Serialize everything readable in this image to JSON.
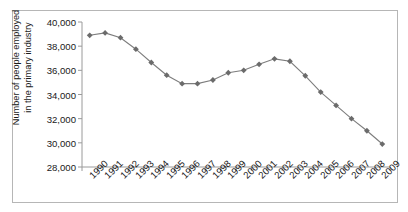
{
  "chart_data": {
    "type": "line",
    "title": "",
    "xlabel": "",
    "ylabel": "Number of people employed\nin the primary industry",
    "ylim": [
      28000,
      40000
    ],
    "ytick_step": 2000,
    "yticks": [
      "28,000",
      "30,000",
      "32,000",
      "34,000",
      "36,000",
      "38,000",
      "40,000"
    ],
    "ytick_values": [
      28000,
      30000,
      32000,
      34000,
      36000,
      38000,
      40000
    ],
    "grid": false,
    "legend": "none",
    "marker": "diamond",
    "line_color": "#7d7d7d",
    "marker_color": "#6b6b6b",
    "axis_color": "#9a9a9a",
    "categories": [
      "1990",
      "1991",
      "1992",
      "1993",
      "1994",
      "1995",
      "1996",
      "1997",
      "1998",
      "1999",
      "2000",
      "2001",
      "2002",
      "2003",
      "2004",
      "2005",
      "2006",
      "2007",
      "2008",
      "2009"
    ],
    "values": [
      38900,
      39100,
      38700,
      37750,
      36650,
      35600,
      34900,
      34900,
      35200,
      35800,
      36000,
      36500,
      36950,
      36750,
      35550,
      34200,
      33100,
      32000,
      31000,
      29900
    ],
    "series": [
      {
        "name": "Number of people employed in the primary industry",
        "values": [
          38900,
          39100,
          38700,
          37750,
          36650,
          35600,
          34900,
          34900,
          35200,
          35800,
          36000,
          36500,
          36950,
          36750,
          35550,
          34200,
          33100,
          32000,
          31000,
          29900
        ]
      }
    ]
  }
}
